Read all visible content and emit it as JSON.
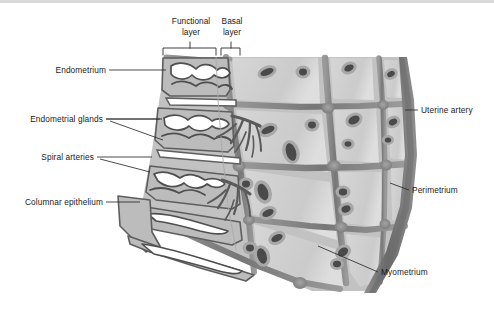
{
  "figure": {
    "background_color": "#ffffff"
  },
  "brackets": {
    "functional": {
      "line1": "Functional",
      "line2": "layer"
    },
    "basal": {
      "line1": "Basal",
      "line2": "layer"
    }
  },
  "labels": {
    "left": [
      {
        "id": "endometrium",
        "text": "Endometrium"
      },
      {
        "id": "endometrial-glands",
        "text": "Endometrial glands"
      },
      {
        "id": "spiral-arteries",
        "text": "Spiral arteries"
      },
      {
        "id": "columnar-epithelium",
        "text": "Columnar epithelium"
      }
    ],
    "right": [
      {
        "id": "uterine-artery",
        "text": "Uterine artery"
      },
      {
        "id": "perimetrium",
        "text": "Perimetrium"
      },
      {
        "id": "myometrium",
        "text": "Myometrium"
      }
    ]
  },
  "colors": {
    "endometrium_fill": "#b9b9b9",
    "endometrium_outline": "#5e5e5e",
    "gland_lumen": "#ffffff",
    "myometrium_cell_fill": "#d0d0d0",
    "myometrium_band": "#8e8e8e",
    "myometrium_band_dark": "#6f6f6f",
    "nucleus_fill": "#4a4a4a",
    "nucleus_halo": "#a8a8a8",
    "leader_line": "#2b2b2b",
    "text": "#1a1a1a",
    "top_edge_band": "#d9d9d9"
  }
}
